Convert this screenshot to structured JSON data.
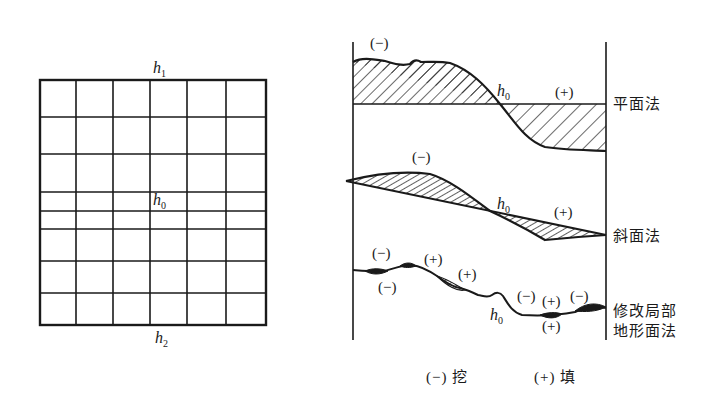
{
  "grid_plan": {
    "top_label": "h",
    "top_sub": "1",
    "center_label": "h",
    "center_sub": "0",
    "bottom_label": "h",
    "bottom_sub": "2",
    "columns": 6,
    "rows": 8
  },
  "profiles": {
    "plane": {
      "name": "平面法",
      "cut_sign": "(−)",
      "fill_sign": "(+)",
      "h_label": "h",
      "h_sub": "0",
      "below_sign": "(−)"
    },
    "slope": {
      "name": "斜面法",
      "cut_sign": "(−)",
      "fill_sign": "(+)",
      "h_label": "h",
      "h_sub": "0"
    },
    "local": {
      "name_line1": "修改局部",
      "name_line2": "地形面法",
      "signs": [
        "(−)",
        "(−)",
        "(+)",
        "(+)",
        "(−)",
        "(+)",
        "(−)",
        "(+)"
      ],
      "h_label": "h",
      "h_sub": "0"
    }
  },
  "legend": {
    "cut": "(−) 挖",
    "fill": "(+) 填"
  },
  "colors": {
    "line": "#1a1a1a",
    "background": "#ffffff"
  }
}
